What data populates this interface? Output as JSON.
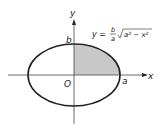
{
  "diagram": {
    "type": "ellipse-area",
    "axes": {
      "x_label": "x",
      "y_label": "y",
      "origin_label": "O"
    },
    "points": {
      "a_label": "a",
      "b_label": "b"
    },
    "equation": {
      "lhs": "y =",
      "frac_num": "b",
      "frac_den": "a",
      "radicand": "a² − x²"
    },
    "shaded_region": "first quadrant of ellipse",
    "colors": {
      "stroke": "#222222",
      "shade": "#c8c8c8",
      "axis": "#444444"
    }
  }
}
